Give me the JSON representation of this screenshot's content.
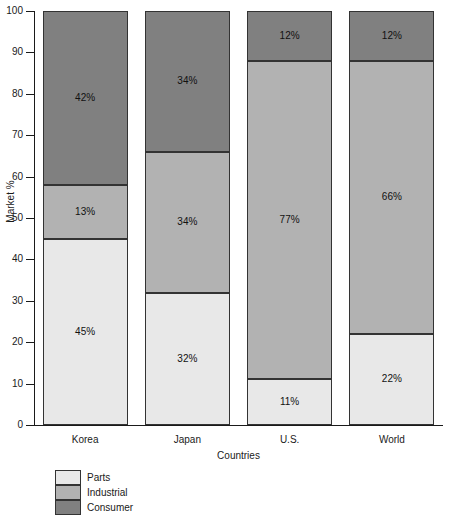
{
  "chart_data": {
    "type": "bar",
    "stacked": true,
    "title": "",
    "xlabel": "Countries",
    "ylabel": "Market %",
    "categories": [
      "Korea",
      "Japan",
      "U.S.",
      "World"
    ],
    "ylim": [
      0,
      100
    ],
    "yticks": [
      0,
      10,
      20,
      30,
      40,
      50,
      60,
      70,
      80,
      90,
      100
    ],
    "ytick_labels": [
      "0",
      "10",
      "20",
      "30",
      "40",
      "50",
      "60",
      "70",
      "80",
      "90",
      "100"
    ],
    "grid": false,
    "legend_position": "below-left",
    "series": [
      {
        "name": "Parts",
        "color": "#e8e8e8",
        "values": [
          45,
          32,
          11,
          22
        ],
        "labels": [
          "45%",
          "32%",
          "11%",
          "22%"
        ]
      },
      {
        "name": "Industrial",
        "color": "#b2b2b2",
        "values": [
          13,
          34,
          77,
          66
        ],
        "labels": [
          "13%",
          "34%",
          "77%",
          "66%"
        ]
      },
      {
        "name": "Consumer",
        "color": "#808080",
        "values": [
          42,
          34,
          12,
          12
        ],
        "labels": [
          "42%",
          "34%",
          "12%",
          "12%"
        ]
      }
    ]
  },
  "legend": {
    "items": [
      {
        "label": "Parts",
        "color": "#e8e8e8"
      },
      {
        "label": "Industrial",
        "color": "#b2b2b2"
      },
      {
        "label": "Consumer",
        "color": "#808080"
      }
    ]
  },
  "axis": {
    "y_title": "Market %",
    "x_title": "Countries"
  }
}
